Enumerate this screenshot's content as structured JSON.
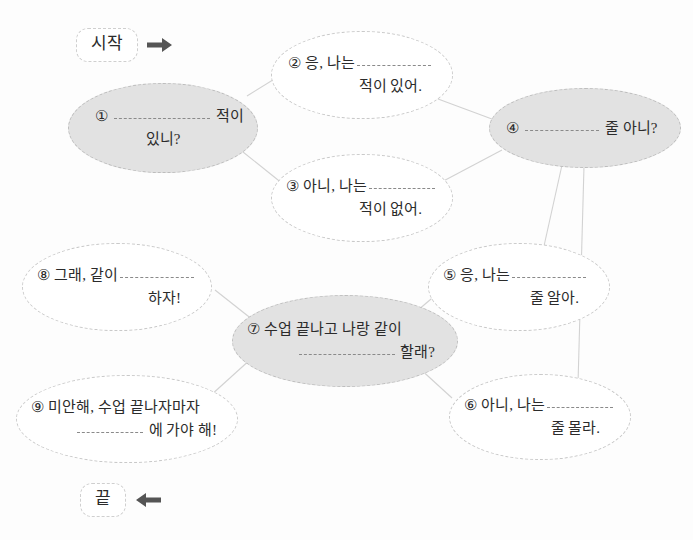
{
  "worksheet": {
    "start_label": "시작",
    "end_label": "끝",
    "start_arrow_icon": "arrow-right-icon",
    "end_arrow_icon": "arrow-left-icon",
    "accent_shaded": "#e2e2e2",
    "outline_color": "#c9c9c9",
    "text_color": "#2b2b2b"
  },
  "bubbles": [
    {
      "number": "①",
      "line1_pre": "",
      "line1_post": "적이",
      "line2": "있니?",
      "shaded": true
    },
    {
      "number": "②",
      "line1_pre": "응, 나는",
      "line1_post": "",
      "line2": "적이 있어.",
      "shaded": false
    },
    {
      "number": "③",
      "line1_pre": "아니, 나는",
      "line1_post": "",
      "line2": "적이 없어.",
      "shaded": false
    },
    {
      "number": "④",
      "line1_pre": "",
      "line1_post": "줄 아니?",
      "line2": "",
      "shaded": true
    },
    {
      "number": "⑤",
      "line1_pre": "응, 나는",
      "line1_post": "",
      "line2": "줄 알아.",
      "shaded": false
    },
    {
      "number": "⑥",
      "line1_pre": "아니, 나는",
      "line1_post": "",
      "line2": "줄 몰라.",
      "shaded": false
    },
    {
      "number": "⑦",
      "line1_pre": "수업 끝나고 나랑 같이",
      "line1_post": "",
      "line2": "할래?",
      "shaded": true
    },
    {
      "number": "⑧",
      "line1_pre": "그래, 같이",
      "line1_post": "",
      "line2": "하자!",
      "shaded": false
    },
    {
      "number": "⑨",
      "line1_pre": "미안해, 수업 끝나자마자",
      "line1_post": "",
      "line2": "에 가야 해!",
      "shaded": false
    }
  ]
}
